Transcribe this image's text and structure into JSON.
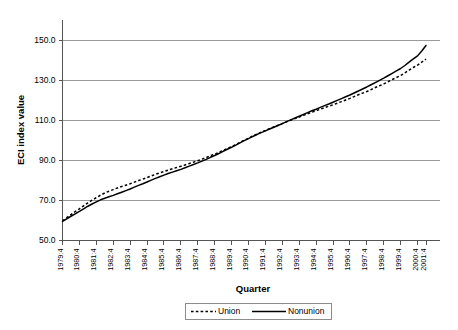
{
  "chart_data": {
    "type": "line",
    "title": "",
    "xlabel": "Quarter",
    "ylabel": "ECI index value",
    "ylim": [
      50.0,
      160.0
    ],
    "grid": true,
    "legend_position": "bottom",
    "ytick_labels": [
      "150.0",
      "130.0",
      "110.0",
      "90.0",
      "70.0",
      "50.0"
    ],
    "ytick_values": [
      150.0,
      130.0,
      110.0,
      90.0,
      70.0,
      50.0
    ],
    "xtick_labels": [
      "1979:4",
      "1980:4",
      "1981:4",
      "1982:4",
      "1983:4",
      "1984:4",
      "1985:4",
      "1986:4",
      "1987:4",
      "1988:4",
      "1989:4",
      "1990:4",
      "1991:4",
      "1992:4",
      "1993:4",
      "1994:4",
      "1995:4",
      "1996:4",
      "1997:4",
      "1998:4",
      "1999:4",
      "2000:4",
      "2001:4"
    ],
    "x": [
      "1979:4",
      "1980:1",
      "1980:2",
      "1980:3",
      "1980:4",
      "1981:1",
      "1981:2",
      "1981:3",
      "1981:4",
      "1982:1",
      "1982:2",
      "1982:3",
      "1982:4",
      "1983:1",
      "1983:2",
      "1983:3",
      "1983:4",
      "1984:1",
      "1984:2",
      "1984:3",
      "1984:4",
      "1985:1",
      "1985:2",
      "1985:3",
      "1985:4",
      "1986:1",
      "1986:2",
      "1986:3",
      "1986:4",
      "1987:1",
      "1987:2",
      "1987:3",
      "1987:4",
      "1988:1",
      "1988:2",
      "1988:3",
      "1988:4",
      "1989:1",
      "1989:2",
      "1989:3",
      "1989:4",
      "1990:1",
      "1990:2",
      "1990:3",
      "1990:4",
      "1991:1",
      "1991:2",
      "1991:3",
      "1991:4",
      "1992:1",
      "1992:2",
      "1992:3",
      "1992:4",
      "1993:1",
      "1993:2",
      "1993:3",
      "1993:4",
      "1994:1",
      "1994:2",
      "1994:3",
      "1994:4",
      "1995:1",
      "1995:2",
      "1995:3",
      "1995:4",
      "1996:1",
      "1996:2",
      "1996:3",
      "1996:4",
      "1997:1",
      "1997:2",
      "1997:3",
      "1997:4",
      "1998:1",
      "1998:2",
      "1998:3",
      "1998:4",
      "1999:1",
      "1999:2",
      "1999:3",
      "1999:4",
      "2000:1",
      "2000:2",
      "2000:3",
      "2000:4",
      "2001:1",
      "2001:2"
    ],
    "series": [
      {
        "name": "Union",
        "style": "dashed",
        "color": "#000000",
        "values": [
          59.8,
          61.4,
          62.9,
          64.4,
          65.8,
          67.3,
          68.8,
          70.1,
          71.4,
          72.6,
          73.7,
          74.6,
          75.4,
          76.2,
          76.9,
          77.6,
          78.3,
          79.1,
          79.9,
          80.6,
          81.4,
          82.2,
          83.0,
          83.7,
          84.4,
          85.1,
          85.8,
          86.4,
          87.0,
          87.7,
          88.4,
          89.1,
          89.8,
          90.6,
          91.4,
          92.3,
          93.1,
          94.0,
          95.0,
          95.9,
          96.8,
          97.9,
          99.0,
          100.0,
          101.0,
          102.1,
          103.1,
          104.0,
          104.9,
          105.8,
          106.7,
          107.5,
          108.3,
          109.2,
          110.0,
          110.8,
          111.6,
          112.4,
          113.2,
          114.0,
          114.7,
          115.5,
          116.3,
          117.0,
          117.7,
          118.5,
          119.3,
          120.1,
          120.9,
          121.8,
          122.7,
          123.5,
          124.3,
          125.3,
          126.3,
          127.2,
          128.1,
          129.2,
          130.3,
          131.3,
          132.3,
          133.6,
          135.0,
          136.3,
          137.5,
          139.0,
          140.5
        ]
      },
      {
        "name": "Nonunion",
        "style": "solid",
        "color": "#000000",
        "values": [
          59.5,
          60.8,
          62.1,
          63.3,
          64.5,
          65.8,
          67.1,
          68.2,
          69.3,
          70.3,
          71.1,
          71.8,
          72.5,
          73.3,
          74.1,
          74.9,
          75.7,
          76.6,
          77.5,
          78.3,
          79.2,
          80.1,
          81.0,
          81.8,
          82.6,
          83.4,
          84.1,
          84.8,
          85.5,
          86.3,
          87.1,
          87.9,
          88.7,
          89.6,
          90.5,
          91.5,
          92.4,
          93.4,
          94.5,
          95.5,
          96.5,
          97.6,
          98.7,
          99.8,
          100.8,
          101.9,
          102.9,
          103.8,
          104.7,
          105.6,
          106.5,
          107.4,
          108.3,
          109.3,
          110.2,
          111.1,
          112.0,
          112.9,
          113.8,
          114.7,
          115.5,
          116.4,
          117.3,
          118.1,
          119.0,
          119.9,
          120.8,
          121.7,
          122.6,
          123.6,
          124.6,
          125.6,
          126.6,
          127.7,
          128.8,
          129.9,
          131.0,
          132.2,
          133.4,
          134.6,
          135.8,
          137.3,
          139.0,
          140.6,
          142.1,
          144.5,
          147.3
        ]
      }
    ],
    "legend_entries": [
      {
        "label": "Union",
        "style": "dashed"
      },
      {
        "label": "Nonunion",
        "style": "solid"
      }
    ]
  }
}
